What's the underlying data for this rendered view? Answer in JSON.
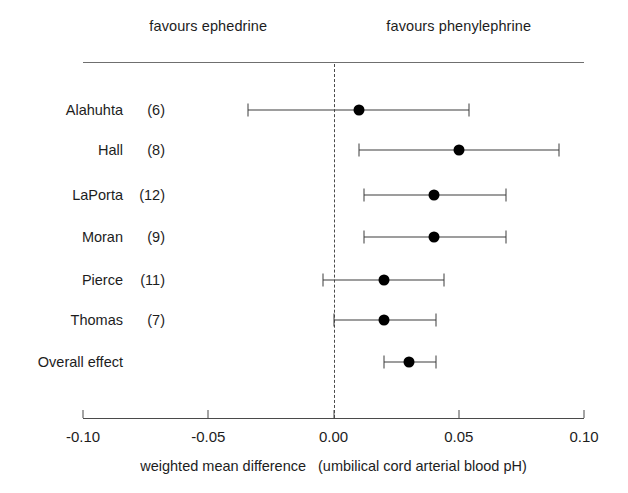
{
  "header": {
    "left_group_label": "favours ephedrine",
    "right_group_label": "favours phenylephrine"
  },
  "axis": {
    "tick_labels": [
      "-0.10",
      "-0.05",
      "0.00",
      "0.05",
      "0.10"
    ],
    "title_main": "weighted mean difference",
    "title_sub": "(umbilical cord arterial blood pH)"
  },
  "rows": [
    {
      "name": "Alahuhta",
      "count": "(6)"
    },
    {
      "name": "Hall",
      "count": "(8)"
    },
    {
      "name": "LaPorta",
      "count": "(12)"
    },
    {
      "name": "Moran",
      "count": "(9)"
    },
    {
      "name": "Pierce",
      "count": "(11)"
    },
    {
      "name": "Thomas",
      "count": "(7)"
    },
    {
      "name": "Overall effect",
      "count": ""
    }
  ],
  "colors": {
    "marker": "#000000",
    "ci_line": "#3c3c3c",
    "axis": "#4a4a4a",
    "zero_line": "#4a4a4a",
    "background": "#ffffff"
  },
  "chart_data": {
    "type": "scatter",
    "subtype": "forest-plot",
    "title": "",
    "xlabel": "weighted mean difference (umbilical cord arterial blood pH)",
    "ylabel": "",
    "xlim": [
      -0.1,
      0.1
    ],
    "xticks": [
      -0.1,
      -0.05,
      0.0,
      0.05,
      0.1
    ],
    "xtick_labels": [
      "-0.10",
      "-0.05",
      "0.00",
      "0.05",
      "0.10"
    ],
    "grid": false,
    "legend": null,
    "reference_line": 0.0,
    "annotations": [
      {
        "text": "favours ephedrine",
        "x": -0.05,
        "position": "top-left"
      },
      {
        "text": "favours phenylephrine",
        "x": 0.05,
        "position": "top-right"
      }
    ],
    "categories": [
      "Alahuhta (6)",
      "Hall (8)",
      "LaPorta (12)",
      "Moran (9)",
      "Pierce (11)",
      "Thomas (7)",
      "Overall effect"
    ],
    "series": [
      {
        "name": "weighted mean difference",
        "points": [
          {
            "label": "Alahuhta",
            "n": 6,
            "estimate": 0.01,
            "ci_low": -0.034,
            "ci_high": 0.054
          },
          {
            "label": "Hall",
            "n": 8,
            "estimate": 0.05,
            "ci_low": 0.01,
            "ci_high": 0.09
          },
          {
            "label": "LaPorta",
            "n": 12,
            "estimate": 0.04,
            "ci_low": 0.012,
            "ci_high": 0.069
          },
          {
            "label": "Moran",
            "n": 9,
            "estimate": 0.04,
            "ci_low": 0.012,
            "ci_high": 0.069
          },
          {
            "label": "Pierce",
            "n": 11,
            "estimate": 0.02,
            "ci_low": -0.004,
            "ci_high": 0.044
          },
          {
            "label": "Thomas",
            "n": 7,
            "estimate": 0.02,
            "ci_low": 0.0,
            "ci_high": 0.041
          },
          {
            "label": "Overall effect",
            "n": null,
            "estimate": 0.03,
            "ci_low": 0.02,
            "ci_high": 0.041
          }
        ]
      }
    ]
  },
  "layout": {
    "x_at_min": 83,
    "x_at_max": 584,
    "x_min_value": -0.1,
    "x_max_value": 0.1,
    "row_y": [
      110,
      150,
      195,
      237,
      280,
      320,
      362
    ],
    "top_rule_y": 62,
    "axis_y": 418,
    "tick_label_y": 428,
    "caption_y": 458,
    "group_label_y": 18,
    "label_right_edge": 165
  }
}
